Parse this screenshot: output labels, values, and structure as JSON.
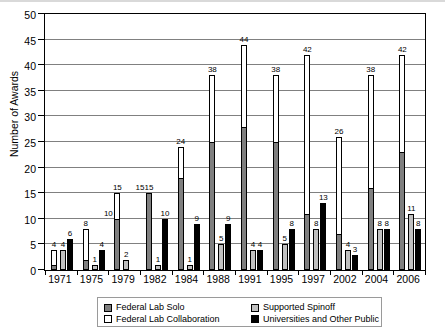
{
  "chart_data": {
    "type": "bar",
    "title": "",
    "xlabel": "",
    "ylabel": "Number of Awards",
    "ylim": [
      0,
      50
    ],
    "ytick_step": 5,
    "yticks": [
      0,
      5,
      10,
      15,
      20,
      25,
      30,
      35,
      40,
      45,
      50
    ],
    "grid": true,
    "legend_position": "bottom",
    "categories": [
      "1971",
      "1975",
      "1979",
      "1982",
      "1984",
      "1988",
      "1991",
      "1995",
      "1997",
      "2002",
      "2004",
      "2006"
    ],
    "series": [
      {
        "name": "Federal Lab Solo",
        "color": "#7f7f7f",
        "values": [
          1,
          2,
          10,
          15,
          18,
          25,
          28,
          25,
          11,
          7,
          16,
          23
        ],
        "labels": [
          "",
          "",
          "10",
          "15",
          "",
          "",
          "",
          "",
          "",
          "",
          "",
          ""
        ]
      },
      {
        "name": "Federal Lab Collaboration",
        "color": "#ffffff",
        "values": [
          4,
          8,
          15,
          15,
          24,
          38,
          44,
          38,
          42,
          26,
          38,
          42
        ],
        "labels": [
          "4",
          "8",
          "15",
          "15",
          "24",
          "38",
          "44",
          "38",
          "42",
          "26",
          "38",
          "42"
        ]
      },
      {
        "name": "Supported Spinoff",
        "color": "#c0c0c0",
        "values": [
          4,
          1,
          2,
          1,
          1,
          5,
          4,
          5,
          8,
          4,
          8,
          11
        ],
        "labels": [
          "4",
          "1",
          "2",
          "1",
          "1",
          "5",
          "4",
          "5",
          "8",
          "4",
          "8",
          "11"
        ]
      },
      {
        "name": "Universities and Other Public",
        "color": "#000000",
        "values": [
          6,
          4,
          0,
          10,
          9,
          9,
          4,
          8,
          13,
          3,
          8,
          8
        ],
        "labels": [
          "6",
          "4",
          "",
          "10",
          "9",
          "9",
          "4",
          "8",
          "13",
          "3",
          "8",
          "8"
        ]
      }
    ]
  },
  "legend": {
    "items": [
      {
        "label": "Federal Lab Solo",
        "swatch": "solo"
      },
      {
        "label": "Supported Spinoff",
        "swatch": "spin"
      },
      {
        "label": "Federal Lab Collaboration",
        "swatch": "collab"
      },
      {
        "label": "Universities and Other Public",
        "swatch": "univ"
      }
    ]
  }
}
